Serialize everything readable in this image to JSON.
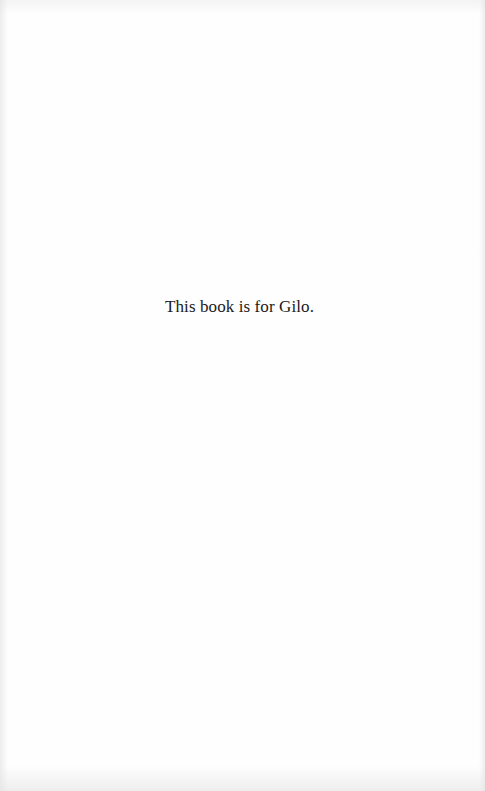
{
  "page": {
    "type": "dedication",
    "text": "This book is for Gilo."
  }
}
